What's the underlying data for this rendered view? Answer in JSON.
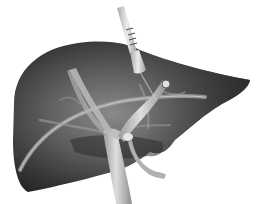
{
  "figure": {
    "alt": "Grayscale illustration of a liver with a probe inserted from above and internal vessels",
    "colors": {
      "background": "#ffffff",
      "liver_dark": "#2a2a2a",
      "liver_mid": "#5a5a5a",
      "liver_light": "#8a8a8a",
      "vessel": "#b4b4b4",
      "vessel_highlight": "#dcdcdc",
      "probe": "#c8c8c8",
      "probe_band": "#555555"
    },
    "parts": [
      "liver",
      "probe",
      "portal-vein",
      "hepatic-vessels",
      "bile-duct",
      "gallbladder-stub"
    ]
  }
}
